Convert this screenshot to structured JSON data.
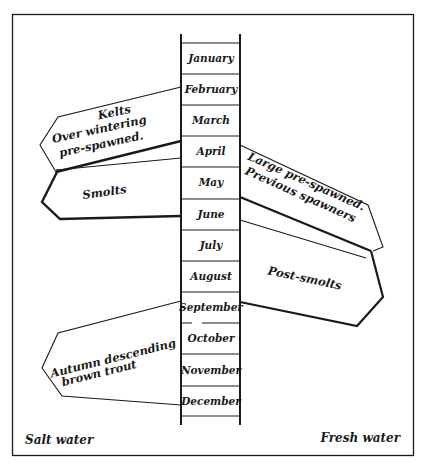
{
  "diagram": {
    "type": "annual timeline with migration arrows",
    "months": [
      "January",
      "February",
      "March",
      "April",
      "May",
      "June",
      "July",
      "August",
      "September",
      "October",
      "November",
      "December"
    ],
    "regions": {
      "left": "Salt water",
      "right": "Fresh water"
    },
    "arrows": [
      {
        "id": "kelts",
        "side": "left",
        "lines": [
          "Kelts",
          "Over wintering",
          "pre-spawned."
        ],
        "from_month": "February",
        "to_month": "April"
      },
      {
        "id": "smolts",
        "side": "left",
        "lines": [
          "Smolts"
        ],
        "from_month": "April",
        "to_month": "June"
      },
      {
        "id": "large-pre-spawned",
        "side": "right",
        "lines": [
          "Large pre-spawned.",
          "Previous spawners"
        ],
        "from_month": "April",
        "to_month": "June"
      },
      {
        "id": "post-smolts",
        "side": "right",
        "lines": [
          "Post-smolts"
        ],
        "from_month": "June",
        "to_month": "September"
      },
      {
        "id": "autumn-brown-trout",
        "side": "left",
        "lines": [
          "Autumn descending",
          "brown trout"
        ],
        "from_month": "September",
        "to_month": "December"
      }
    ],
    "colors": {
      "ink": "#1a1a1a",
      "paper": "#ffffff"
    }
  }
}
